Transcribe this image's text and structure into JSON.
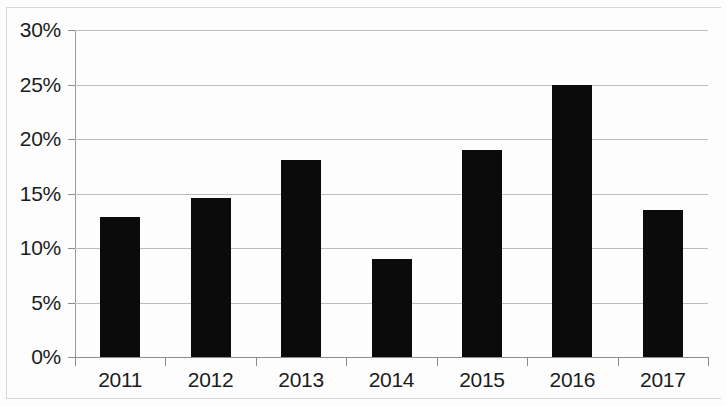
{
  "chart_data": {
    "type": "bar",
    "title": "",
    "subtitle": "",
    "xlabel": "",
    "ylabel": "",
    "categories": [
      "2011",
      "2012",
      "2013",
      "2014",
      "2015",
      "2016",
      "2017"
    ],
    "values": [
      12.8,
      14.6,
      18.1,
      9.0,
      19.0,
      25.0,
      13.5
    ],
    "value_format": "percent",
    "ylim": [
      0,
      30
    ],
    "ytick_values": [
      0,
      5,
      10,
      15,
      20,
      25,
      30
    ],
    "ytick_labels": [
      "0%",
      "5%",
      "10%",
      "15%",
      "20%",
      "25%",
      "30%"
    ],
    "grid": true,
    "grid_axis": "y",
    "legend": null,
    "legend_position": "none",
    "annotations": [],
    "series": [
      {
        "name": "",
        "values": [
          12.8,
          14.6,
          18.1,
          9.0,
          19.0,
          25.0,
          13.5
        ],
        "color": "#0b0b0b"
      }
    ]
  },
  "colors": {
    "bar": "#0b0b0b",
    "gridline": "#bdbdbd",
    "axis": "#8d8d8d",
    "text": "#1c1c1c",
    "background": "#fdfdfd"
  }
}
